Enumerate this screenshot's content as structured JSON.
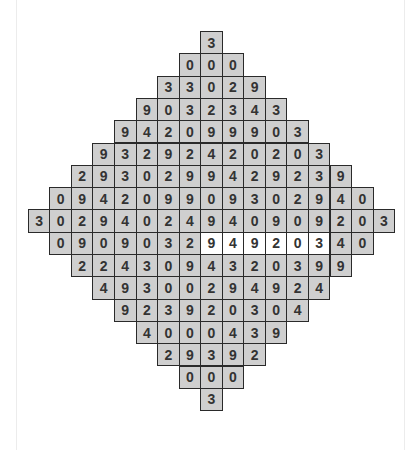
{
  "puzzle": {
    "shape": "diamond",
    "colors": {
      "cell_fill": "#cfcfcf",
      "highlight_fill": "#ffffff",
      "border": "#2a2a2a",
      "digit": "#333333"
    },
    "rows": [
      {
        "cells": [
          "3"
        ]
      },
      {
        "cells": [
          "0",
          "0",
          "0"
        ]
      },
      {
        "cells": [
          "3",
          "3",
          "0",
          "2",
          "9"
        ]
      },
      {
        "cells": [
          "9",
          "0",
          "3",
          "2",
          "3",
          "4",
          "3"
        ]
      },
      {
        "cells": [
          "9",
          "4",
          "2",
          "0",
          "9",
          "9",
          "9",
          "0",
          "3"
        ]
      },
      {
        "cells": [
          "9",
          "3",
          "2",
          "9",
          "2",
          "4",
          "2",
          "0",
          "2",
          "0",
          "3"
        ]
      },
      {
        "cells": [
          "2",
          "9",
          "3",
          "0",
          "2",
          "9",
          "9",
          "4",
          "2",
          "9",
          "2",
          "3",
          "9"
        ]
      },
      {
        "cells": [
          "0",
          "9",
          "4",
          "2",
          "0",
          "9",
          "9",
          "0",
          "9",
          "3",
          "0",
          "2",
          "9",
          "4",
          "0"
        ]
      },
      {
        "cells": [
          "3",
          "0",
          "2",
          "9",
          "4",
          "0",
          "2",
          "4",
          "9",
          "4",
          "0",
          "9",
          "0",
          "9",
          "2",
          "0",
          "3"
        ]
      },
      {
        "cells": [
          "0",
          "9",
          "0",
          "9",
          "0",
          "3",
          "2",
          "9",
          "4",
          "9",
          "2",
          "0",
          "3",
          "4",
          "0"
        ],
        "highlighted": [
          7,
          8,
          9,
          10,
          11,
          12
        ]
      },
      {
        "cells": [
          "2",
          "2",
          "4",
          "3",
          "0",
          "9",
          "4",
          "3",
          "2",
          "0",
          "3",
          "9",
          "9"
        ]
      },
      {
        "cells": [
          "4",
          "9",
          "3",
          "0",
          "0",
          "2",
          "9",
          "4",
          "9",
          "2",
          "4"
        ]
      },
      {
        "cells": [
          "9",
          "2",
          "3",
          "9",
          "2",
          "0",
          "3",
          "0",
          "4"
        ]
      },
      {
        "cells": [
          "4",
          "0",
          "0",
          "0",
          "4",
          "3",
          "9"
        ]
      },
      {
        "cells": [
          "2",
          "9",
          "3",
          "9",
          "2"
        ]
      },
      {
        "cells": [
          "0",
          "0",
          "0"
        ]
      },
      {
        "cells": [
          "3"
        ]
      }
    ]
  }
}
